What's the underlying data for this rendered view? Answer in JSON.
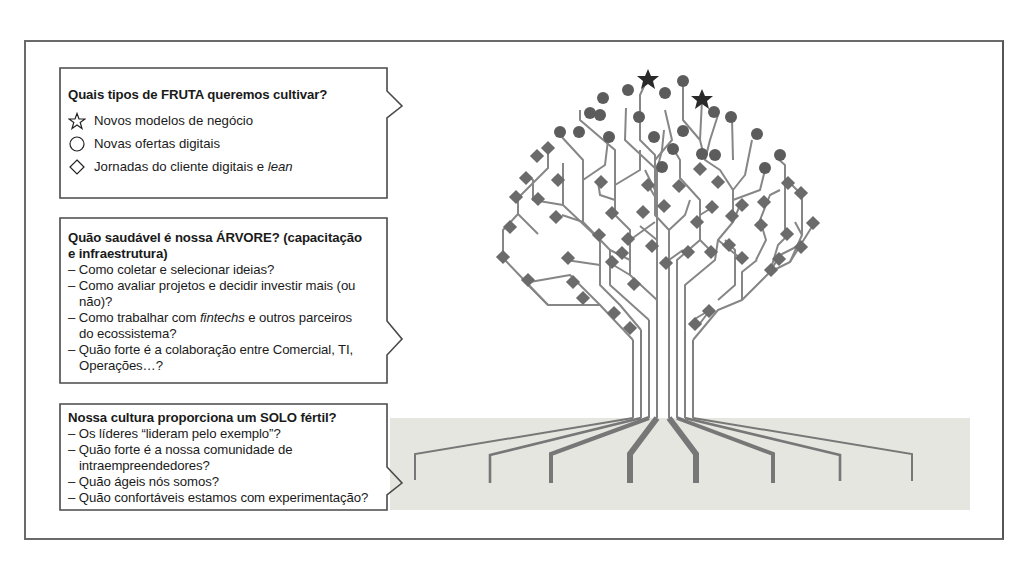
{
  "fruit_box": {
    "title": "Quais tipos de FRUTA queremos cultivar?",
    "legend": [
      {
        "icon": "star-icon",
        "label": "Novos modelos de negócio"
      },
      {
        "icon": "circle-icon",
        "label": "Novas ofertas digitais"
      },
      {
        "icon": "diamond-icon",
        "label_prefix": "Jornadas do cliente digitais e ",
        "label_italic": "lean"
      }
    ]
  },
  "tree_box": {
    "title_line1": "Quão saudável é nossa ÁRVORE? (capacitação",
    "title_line2": "e infraestrutura)",
    "items": [
      {
        "line1": "– Como coletar e selecionar ideias?"
      },
      {
        "line1": "– Como avaliar projetos e decidir investir mais (ou",
        "line2": "não)?"
      },
      {
        "line1_prefix": "– Como trabalhar com ",
        "line1_italic": "fintechs",
        "line1_suffix": " e outros parceiros",
        "line2": "do ecossistema?"
      },
      {
        "line1": "– Quão forte é a colaboração entre Comercial, TI,",
        "line2": "Operações…?"
      }
    ]
  },
  "soil_box": {
    "title": "Nossa cultura proporciona um SOLO fértil?",
    "items": [
      {
        "line1": "– Os líderes “lideram pelo exemplo”?"
      },
      {
        "line1": "– Quão forte é a nossa comunidade de",
        "line2": "intraempreendedores?"
      },
      {
        "line1": "– Quão ágeis nós somos?"
      },
      {
        "line1": "– Quão confortáveis estamos com experimentação?"
      }
    ]
  },
  "colors": {
    "frame": "#666666",
    "circuit": "#7a7a7a",
    "node_diamond": "#6e6e6e",
    "node_circle": "#5e5e5e",
    "node_star": "#2b2b2b",
    "soil": "#e4e4df"
  }
}
